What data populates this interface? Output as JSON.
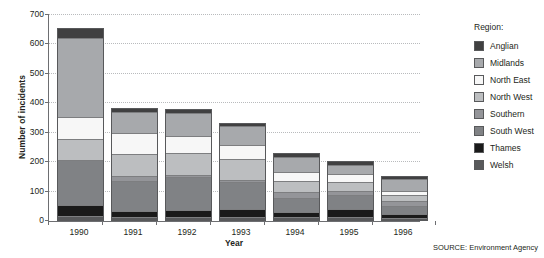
{
  "chart_data": {
    "type": "bar",
    "subtype": "stacked-vertical",
    "title": "",
    "xlabel": "Year",
    "ylabel": "Number of incidents",
    "categories": [
      "1990",
      "1991",
      "1992",
      "1993",
      "1994",
      "1995",
      "1996"
    ],
    "ylim": [
      0,
      700
    ],
    "yticks": [
      0,
      100,
      200,
      300,
      400,
      500,
      600,
      700
    ],
    "ytick_labels": [
      "0",
      "100",
      "200",
      "300",
      "400",
      "500",
      "600",
      "700"
    ],
    "grid": "horizontal-dotted",
    "legend_title": "Region:",
    "legend_position": "right",
    "stack_order_bottom_to_top": [
      "Welsh",
      "Thames",
      "South West",
      "Southern",
      "North West",
      "North East",
      "Midlands",
      "Anglian"
    ],
    "series": [
      {
        "name": "Welsh",
        "color": "#58595b",
        "values": [
          10,
          6,
          6,
          6,
          6,
          6,
          5
        ]
      },
      {
        "name": "Thames",
        "color": "#1a1a1a",
        "values": [
          38,
          22,
          25,
          30,
          20,
          30,
          14
        ]
      },
      {
        "name": "South West",
        "color": "#808285",
        "values": [
          155,
          103,
          115,
          92,
          48,
          50,
          28
        ]
      },
      {
        "name": "Southern",
        "color": "#949599",
        "values": [
          0,
          18,
          8,
          6,
          20,
          12,
          16
        ]
      },
      {
        "name": "North West",
        "color": "#bcbec0",
        "values": [
          72,
          75,
          75,
          73,
          38,
          33,
          22
        ]
      },
      {
        "name": "North East",
        "color": "#f7f7f7",
        "values": [
          75,
          72,
          58,
          48,
          32,
          28,
          14
        ]
      },
      {
        "name": "Midlands",
        "color": "#a7a9ac",
        "values": [
          271,
          73,
          81,
          68,
          54,
          32,
          44
        ]
      },
      {
        "name": "Anglian",
        "color": "#404041",
        "values": [
          34,
          14,
          14,
          9,
          12,
          13,
          11
        ]
      }
    ],
    "totals": [
      655,
      383,
      382,
      332,
      230,
      204,
      154
    ],
    "source": "SOURCE: Environment Agency"
  },
  "geometry": {
    "bar_width_px": 47,
    "bar_centers_px": [
      31,
      85,
      139,
      193,
      247,
      301,
      355
    ]
  }
}
